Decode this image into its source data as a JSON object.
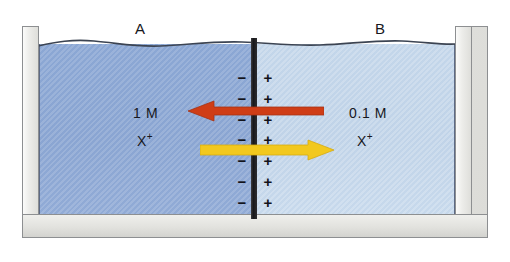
{
  "figure": {
    "type": "membrane-potential-diagram"
  },
  "compartments": {
    "left": {
      "label": "A",
      "concentration": "1 M",
      "ion": "X",
      "ion_charge": "+",
      "ion_full": "X+",
      "liquid_color": "#8aa5d2",
      "membrane_charge_symbol": "−",
      "membrane_charge_count": 7
    },
    "right": {
      "label": "B",
      "concentration": "0.1 M",
      "ion": "X",
      "ion_charge": "+",
      "ion_full": "X+",
      "liquid_color": "#c0d3e8",
      "membrane_charge_symbol": "+",
      "membrane_charge_count": 7
    }
  },
  "membrane": {
    "name": "semipermeable-membrane",
    "color": "#1d1d20"
  },
  "arrows": [
    {
      "name": "electrical-force-arrow",
      "direction": "left",
      "color": "#cf3d16",
      "meaning": "electrical gradient driving X+ toward compartment A"
    },
    {
      "name": "concentration-force-arrow",
      "direction": "right",
      "color": "#f2c81e",
      "meaning": "concentration gradient driving X+ toward compartment B"
    }
  ],
  "vessel": {
    "name": "container",
    "wall_color": "#e6e6e3",
    "outline_color": "#8d8f91"
  },
  "charge_symbols": {
    "negative": "−",
    "positive": "+"
  }
}
